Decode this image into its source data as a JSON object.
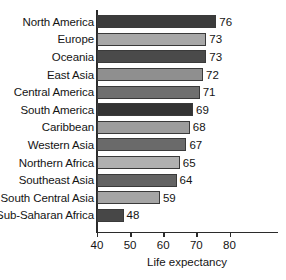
{
  "chart_data": {
    "type": "bar",
    "orientation": "horizontal",
    "title": "",
    "xlabel": "Life expectancy",
    "ylabel": "",
    "xlim": [
      40,
      84
    ],
    "xticks": [
      40,
      50,
      60,
      70,
      80
    ],
    "grid": false,
    "legend": null,
    "categories": [
      "North America",
      "Europe",
      "Oceania",
      "East Asia",
      "Central America",
      "South America",
      "Caribbean",
      "Western Asia",
      "Northern Africa",
      "Southeast Asia",
      "South Central Asia",
      "Sub-Saharan Africa"
    ],
    "values": [
      76,
      73,
      73,
      72,
      71,
      69,
      68,
      67,
      65,
      64,
      59,
      48
    ],
    "bar_colors": [
      "#3b3b3b",
      "#a8a8a8",
      "#4a4a4a",
      "#8f8f8f",
      "#6f6f6f",
      "#333333",
      "#9d9d9d",
      "#6a6a6a",
      "#b0b0b0",
      "#636363",
      "#a5a5a5",
      "#474747"
    ]
  },
  "axis": {
    "tick_labels": [
      "40",
      "50",
      "60",
      "70",
      "80"
    ],
    "title": "Life expectancy"
  },
  "colors": {
    "background": "#ffffff",
    "axis": "#2b2b2b",
    "text": "#141414",
    "bar_outline": "#3a3a3a"
  }
}
